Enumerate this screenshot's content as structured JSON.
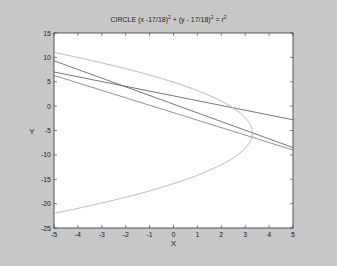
{
  "chart_data": {
    "type": "line",
    "title_parts": {
      "a": "CIRCLE (x -17/18)",
      "b": "2",
      "c": " + (y - 17/18)",
      "d": "2",
      "e": " = r",
      "f": "2"
    },
    "xlabel": "X",
    "ylabel": "Y",
    "xlim": [
      -5,
      5
    ],
    "ylim": [
      -25,
      15
    ],
    "xticks": [
      -5,
      -4,
      -3,
      -2,
      -1,
      0,
      1,
      2,
      3,
      4,
      5
    ],
    "yticks": [
      15,
      10,
      5,
      0,
      -5,
      -10,
      -15,
      -20,
      -25
    ],
    "grid": false,
    "series": [
      {
        "name": "line-1",
        "color": "#555555",
        "x": [
          -5,
          5
        ],
        "y": [
          9.3,
          -8.5
        ]
      },
      {
        "name": "line-2",
        "color": "#555555",
        "x": [
          -5,
          5
        ],
        "y": [
          7,
          -2.8
        ]
      },
      {
        "name": "line-3",
        "color": "#777777",
        "x": [
          -5,
          5
        ],
        "y": [
          6.3,
          -9
        ]
      },
      {
        "name": "parabola",
        "color": "#aaaaaa",
        "vertex": [
          3.3,
          -5.5
        ],
        "x_at_edges": -5,
        "y_range": [
          -22,
          11
        ]
      }
    ]
  }
}
